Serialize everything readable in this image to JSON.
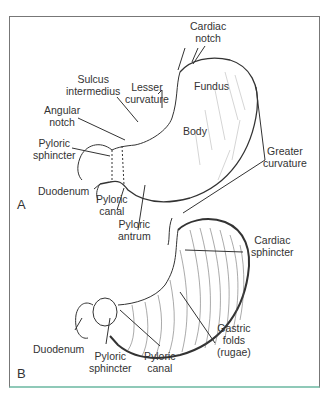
{
  "figure": {
    "panels": [
      {
        "id": "A",
        "letter": "A",
        "labels": {
          "cardiac_notch": [
            "Cardiac",
            "notch"
          ],
          "sulcus_intermedius": [
            "Sulcus",
            "intermedius"
          ],
          "lesser_curvature": [
            "Lesser",
            "curvature"
          ],
          "fundus": [
            "Fundus"
          ],
          "angular_notch": [
            "Angular",
            "notch"
          ],
          "body": [
            "Body"
          ],
          "pyloric_sphincter": [
            "Pyloric",
            "sphincter"
          ],
          "greater_curvature": [
            "Greater",
            "curvature"
          ],
          "duodenum": [
            "Duodenum"
          ],
          "pyloric_canal": [
            "Pyloric",
            "canal"
          ],
          "pyloric_antrum": [
            "Pyloric",
            "antrum"
          ]
        }
      },
      {
        "id": "B",
        "letter": "B",
        "labels": {
          "cardiac_sphincter": [
            "Cardiac",
            "sphincter"
          ],
          "gastric_folds": [
            "Gastric",
            "folds",
            "(rugae)"
          ],
          "duodenum": [
            "Duodenum"
          ],
          "pyloric_sphincter": [
            "Pyloric",
            "sphincter"
          ],
          "pyloric_canal": [
            "Pyloric",
            "canal"
          ]
        }
      }
    ],
    "colors": {
      "ink": "#333333",
      "frame": "#777777",
      "frame_bottom": "#8fc9b8"
    }
  }
}
